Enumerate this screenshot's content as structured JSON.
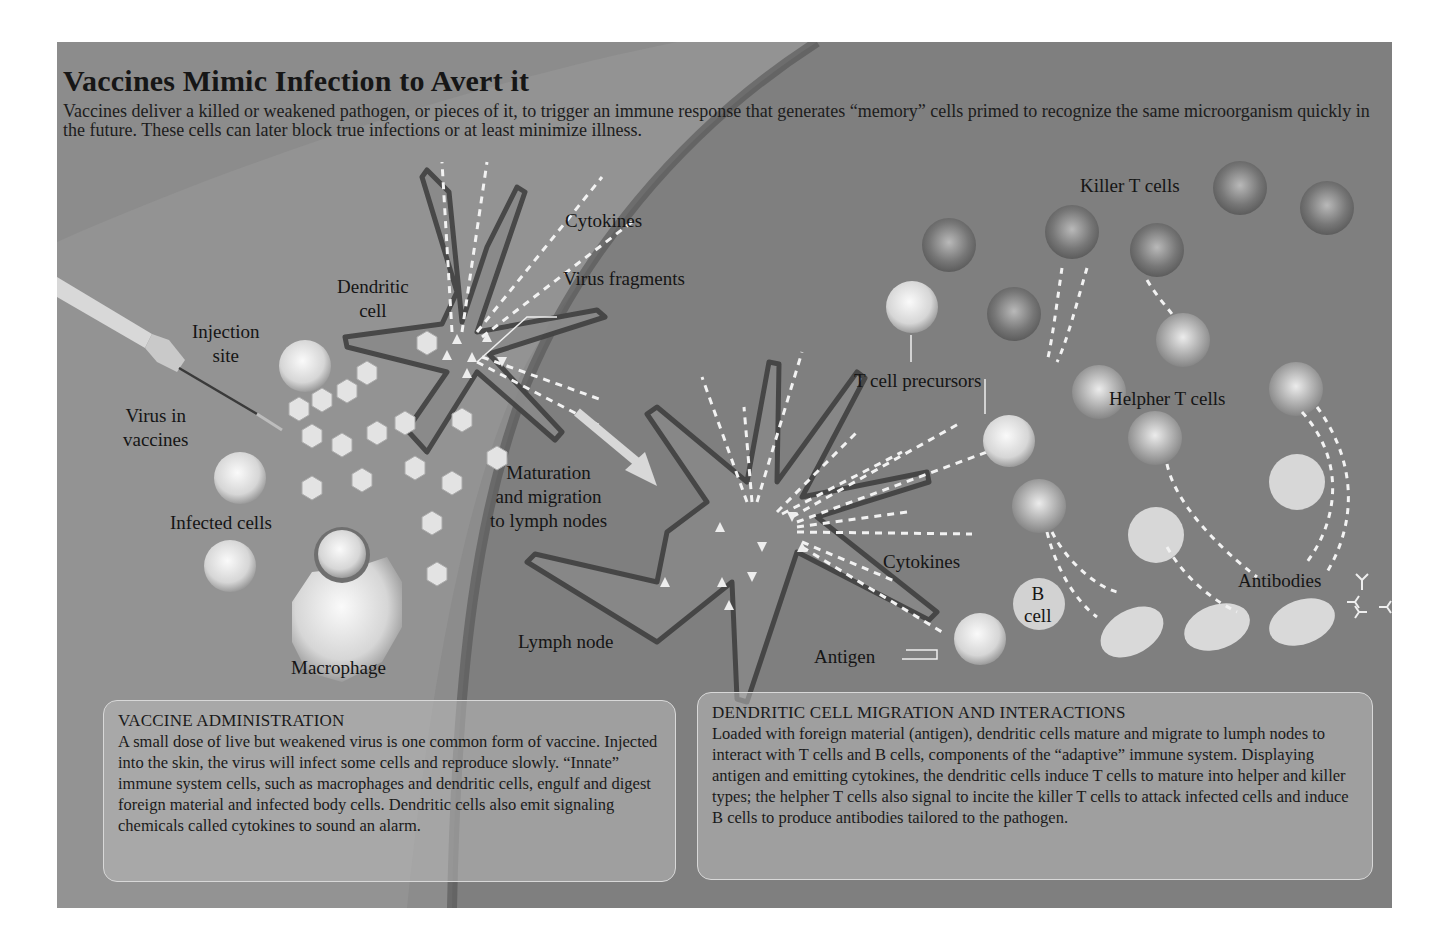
{
  "figure": {
    "title": "Vaccines Mimic Infection to Avert it",
    "intro": "Vaccines deliver a killed or weakened pathogen, or pieces of it, to trigger an immune response that  generates “memory” cells primed to recognize the same microorganism quickly in the future. These cells can later block true infections or at least minimize illness.",
    "colors": {
      "panel_bg": "#8c8c8c",
      "lymph_node_bg": "#7e7e7e",
      "skin_band": "#939393",
      "cell_light": "#e6e6e6",
      "cell_dark": "#6e6e6e",
      "text": "#1a1a1a",
      "dashed_signal": "#f2f2f2"
    }
  },
  "labels": {
    "injection_site": [
      "Injection",
      "site"
    ],
    "virus_in_vaccines": [
      "Virus in",
      "vaccines"
    ],
    "infected_cells": "Infected cells",
    "macrophage": "Macrophage",
    "dendritic_cell": [
      "Dendritic",
      "cell"
    ],
    "cytokines_top": "Cytokines",
    "virus_fragments": "Virus fragments",
    "maturation": [
      "Maturation",
      "and migration",
      "to lymph nodes"
    ],
    "lymph_node": "Lymph node",
    "killer_t_cells": "Killer T cells",
    "t_cell_precursors": "T cell precursors",
    "helpher_t_cells": "Helpher T cells",
    "cytokines_bottom": "Cytokines",
    "b_cell": [
      "B",
      "cell"
    ],
    "antibodies": "Antibodies",
    "antigen": "Antigen"
  },
  "panels": [
    {
      "heading": "VACCINE ADMINISTRATION",
      "body": "A small dose of live but weakened virus is one common form of vaccine. Injected into the skin, the virus will infect some cells and reproduce slowly. “Innate” immune system cells, such as macrophages and dendritic cells, engulf and digest foreign material and infected body cells. Dendritic cells also emit signaling chemicals called cytokines to sound an alarm."
    },
    {
      "heading": "DENDRITIC CELL MIGRATION AND INTERACTIONS",
      "body": "Loaded with foreign material (antigen), dendritic cells mature and migrate to lumph nodes to interact with T cells and B cells, components of the “adaptive” immune system. Displaying antigen and emitting cytokines, the dendritic cells induce T cells to mature into helper and killer types; the helpher T cells also signal to incite the killer T cells to attack infected cells and induce B cells to produce antibodies tailored to the pathogen."
    }
  ],
  "icons": {
    "syringe": "syringe-icon",
    "virus_particle": "hexagon-virus-icon",
    "infected_cell": "sphere-cell-icon",
    "macrophage": "octagon-macrophage-icon",
    "dendritic_cell": "star-dendritic-cell-icon",
    "t_cell": "sphere-tcell-icon",
    "b_cell": "sphere-bcell-icon",
    "plasma_cell": "ellipse-plasma-cell-icon",
    "antibody": "y-antibody-icon",
    "arrow": "migration-arrow-icon"
  }
}
